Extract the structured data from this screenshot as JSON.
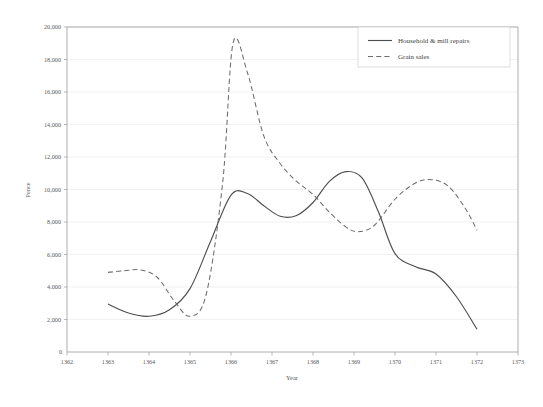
{
  "chart_data": {
    "type": "line",
    "title": "",
    "xlabel": "Year",
    "ylabel": "Pence",
    "xlim": [
      1362,
      1373
    ],
    "ylim": [
      0,
      20000
    ],
    "grid": true,
    "legend_position": "top-right",
    "x_ticks": [
      "1362",
      "1363",
      "1364",
      "1365",
      "1366",
      "1367",
      "1368",
      "1369",
      "1370",
      "1371",
      "1372",
      "1373"
    ],
    "y_ticks": [
      "0",
      "2,000",
      "4,000",
      "6,000",
      "8,000",
      "10,000",
      "12,000",
      "14,000",
      "16,000",
      "18,000",
      "20,000"
    ],
    "y_tick_values": [
      0,
      2000,
      4000,
      6000,
      8000,
      10000,
      12000,
      14000,
      16000,
      18000,
      20000
    ],
    "series": [
      {
        "name": "Household & mill repairs",
        "style": "solid",
        "color": "#4f4f4f",
        "x": [
          1363,
          1363.5,
          1364,
          1364.5,
          1365,
          1365.5,
          1366,
          1366.4,
          1366.8,
          1367.2,
          1367.6,
          1368,
          1368.4,
          1368.8,
          1369.2,
          1369.6,
          1370,
          1370.5,
          1371,
          1371.5,
          1372
        ],
        "values": [
          2950,
          2400,
          2200,
          2600,
          3900,
          6800,
          9650,
          9750,
          9000,
          8350,
          8400,
          9200,
          10500,
          11100,
          10700,
          8600,
          6050,
          5250,
          4800,
          3400,
          1400
        ]
      },
      {
        "name": "Grain sales",
        "style": "dashed",
        "color": "#6d6d6d",
        "x": [
          1363,
          1363.4,
          1363.8,
          1364.2,
          1364.6,
          1365,
          1365.4,
          1365.8,
          1366.05,
          1366.4,
          1366.8,
          1367.2,
          1367.6,
          1368,
          1368.4,
          1368.8,
          1369.1,
          1369.5,
          1370,
          1370.5,
          1370.9,
          1371.3,
          1371.7,
          1372
        ],
        "values": [
          4900,
          5000,
          5050,
          4600,
          3200,
          2200,
          3600,
          10500,
          19000,
          17200,
          13300,
          11600,
          10500,
          9700,
          8600,
          7700,
          7400,
          7800,
          9400,
          10400,
          10600,
          10200,
          8900,
          7500
        ]
      }
    ]
  },
  "axes": {
    "y_origin_label": "0"
  }
}
